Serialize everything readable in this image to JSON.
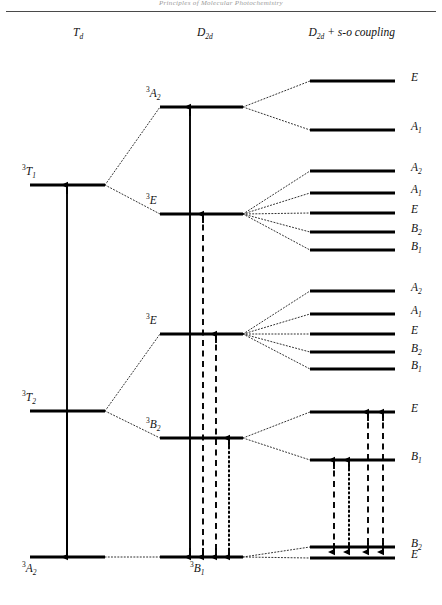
{
  "page": {
    "running_head": "Principles of Molecular Photochemistry",
    "width": 442,
    "height": 605
  },
  "columns": [
    {
      "id": "td",
      "label_html": "T<sub>d</sub>",
      "label": "Td",
      "x": 78
    },
    {
      "id": "d2d",
      "label_html": "D<sub>2d</sub>",
      "label": "D2d",
      "x": 205
    },
    {
      "id": "so",
      "label_html": "D<sub>2d</sub> + s-o coupling",
      "label": "D2d + s-o coupling",
      "x": 352
    }
  ],
  "levels": {
    "td": [
      {
        "name": "3T1",
        "label_sup": "3",
        "label_main": "T",
        "label_sub": "1",
        "y": 185,
        "x1": 30,
        "x2": 105,
        "label_x": 22,
        "label_y": 163
      },
      {
        "name": "3T2",
        "label_sup": "3",
        "label_main": "T",
        "label_sub": "2",
        "y": 411,
        "x1": 30,
        "x2": 105,
        "label_x": 22,
        "label_y": 389
      },
      {
        "name": "3A2",
        "label_sup": "3",
        "label_main": "A",
        "label_sub": "2",
        "y": 557,
        "x1": 30,
        "x2": 105,
        "label_x": 22,
        "label_y": 560
      }
    ],
    "d2d": [
      {
        "name": "3A2",
        "label_sup": "3",
        "label_main": "A",
        "label_sub": "2",
        "y": 107,
        "x1": 160,
        "x2": 243,
        "label_x": 146,
        "label_y": 85
      },
      {
        "name": "3E-upper",
        "label_sup": "3",
        "label_main": "E",
        "label_sub": "",
        "y": 214,
        "x1": 160,
        "x2": 243,
        "label_x": 146,
        "label_y": 192
      },
      {
        "name": "3E-lower",
        "label_sup": "3",
        "label_main": "E",
        "label_sub": "",
        "y": 334,
        "x1": 160,
        "x2": 243,
        "label_x": 146,
        "label_y": 312
      },
      {
        "name": "3B2",
        "label_sup": "3",
        "label_main": "B",
        "label_sub": "2",
        "y": 438,
        "x1": 160,
        "x2": 243,
        "label_x": 146,
        "label_y": 416
      },
      {
        "name": "3B1",
        "label_sup": "3",
        "label_main": "B",
        "label_sub": "1",
        "y": 557,
        "x1": 160,
        "x2": 243,
        "label_x": 190,
        "label_y": 560
      }
    ],
    "so": [
      {
        "name": "E-1",
        "label_main": "E",
        "label_sub": "",
        "y": 81,
        "x1": 310,
        "x2": 395
      },
      {
        "name": "A1-1",
        "label_main": "A",
        "label_sub": "1",
        "y": 130,
        "x1": 310,
        "x2": 395
      },
      {
        "name": "A2-2",
        "label_main": "A",
        "label_sub": "2",
        "y": 171,
        "x1": 310,
        "x2": 395
      },
      {
        "name": "A1-2",
        "label_main": "A",
        "label_sub": "1",
        "y": 193,
        "x1": 310,
        "x2": 395
      },
      {
        "name": "E-2",
        "label_main": "E",
        "label_sub": "",
        "y": 213,
        "x1": 310,
        "x2": 395
      },
      {
        "name": "B2-2",
        "label_main": "B",
        "label_sub": "2",
        "y": 232,
        "x1": 310,
        "x2": 395
      },
      {
        "name": "B1-2",
        "label_main": "B",
        "label_sub": "1",
        "y": 250,
        "x1": 310,
        "x2": 395
      },
      {
        "name": "A2-3",
        "label_main": "A",
        "label_sub": "2",
        "y": 291,
        "x1": 310,
        "x2": 395
      },
      {
        "name": "A1-3",
        "label_main": "A",
        "label_sub": "1",
        "y": 314,
        "x1": 310,
        "x2": 395
      },
      {
        "name": "E-3",
        "label_main": "E",
        "label_sub": "",
        "y": 334,
        "x1": 310,
        "x2": 395
      },
      {
        "name": "B2-3",
        "label_main": "B",
        "label_sub": "2",
        "y": 352,
        "x1": 310,
        "x2": 395
      },
      {
        "name": "B1-3",
        "label_main": "B",
        "label_sub": "1",
        "y": 369,
        "x1": 310,
        "x2": 395
      },
      {
        "name": "E-4",
        "label_main": "E",
        "label_sub": "",
        "y": 412,
        "x1": 310,
        "x2": 395
      },
      {
        "name": "B1-4",
        "label_main": "B",
        "label_sub": "1",
        "y": 460,
        "x1": 310,
        "x2": 395
      },
      {
        "name": "B2-5",
        "label_main": "B",
        "label_sub": "2",
        "y": 547,
        "x1": 310,
        "x2": 395
      },
      {
        "name": "E-5",
        "label_main": "E",
        "label_sub": "",
        "y": 558,
        "x1": 310,
        "x2": 395
      }
    ]
  },
  "correlations": [
    {
      "from_x": 105,
      "from_y": 185,
      "to_x": 160,
      "to_y": 107
    },
    {
      "from_x": 105,
      "from_y": 185,
      "to_x": 160,
      "to_y": 214
    },
    {
      "from_x": 105,
      "from_y": 411,
      "to_x": 160,
      "to_y": 334
    },
    {
      "from_x": 105,
      "from_y": 411,
      "to_x": 160,
      "to_y": 438
    },
    {
      "from_x": 105,
      "from_y": 557,
      "to_x": 160,
      "to_y": 557
    },
    {
      "from_x": 243,
      "from_y": 107,
      "to_x": 310,
      "to_y": 81
    },
    {
      "from_x": 243,
      "from_y": 107,
      "to_x": 310,
      "to_y": 130
    },
    {
      "from_x": 243,
      "from_y": 214,
      "to_x": 310,
      "to_y": 171
    },
    {
      "from_x": 243,
      "from_y": 214,
      "to_x": 310,
      "to_y": 193
    },
    {
      "from_x": 243,
      "from_y": 214,
      "to_x": 310,
      "to_y": 213
    },
    {
      "from_x": 243,
      "from_y": 214,
      "to_x": 310,
      "to_y": 232
    },
    {
      "from_x": 243,
      "from_y": 214,
      "to_x": 310,
      "to_y": 250
    },
    {
      "from_x": 243,
      "from_y": 334,
      "to_x": 310,
      "to_y": 291
    },
    {
      "from_x": 243,
      "from_y": 334,
      "to_x": 310,
      "to_y": 314
    },
    {
      "from_x": 243,
      "from_y": 334,
      "to_x": 310,
      "to_y": 334
    },
    {
      "from_x": 243,
      "from_y": 334,
      "to_x": 310,
      "to_y": 352
    },
    {
      "from_x": 243,
      "from_y": 334,
      "to_x": 310,
      "to_y": 369
    },
    {
      "from_x": 243,
      "from_y": 438,
      "to_x": 310,
      "to_y": 412
    },
    {
      "from_x": 243,
      "from_y": 438,
      "to_x": 310,
      "to_y": 460
    },
    {
      "from_x": 243,
      "from_y": 557,
      "to_x": 310,
      "to_y": 547
    },
    {
      "from_x": 243,
      "from_y": 557,
      "to_x": 310,
      "to_y": 558
    }
  ],
  "transitions": [
    {
      "name": "td-absorption-T1",
      "x": 67,
      "y_top": 185,
      "y_bottom": 557,
      "style": "solid",
      "arrow": "up"
    },
    {
      "name": "td-absorption-T2",
      "x": 67,
      "y_top": 411,
      "y_bottom": 557,
      "style": "solid",
      "arrow": "down"
    },
    {
      "name": "d2d-A2-abs",
      "x": 190,
      "y_top": 107,
      "y_bottom": 557,
      "style": "solid",
      "arrow": "both"
    },
    {
      "name": "d2d-E-upper-abs",
      "x": 203,
      "y_top": 214,
      "y_bottom": 557,
      "style": "dashed",
      "arrow": "both"
    },
    {
      "name": "d2d-E-lower-abs",
      "x": 216,
      "y_top": 334,
      "y_bottom": 557,
      "style": "dashed",
      "arrow": "both"
    },
    {
      "name": "d2d-B2-abs",
      "x": 229,
      "y_top": 438,
      "y_bottom": 557,
      "style": "dotted",
      "arrow": "both"
    },
    {
      "name": "so-B1-to-bottom-a",
      "x": 334,
      "y_top": 460,
      "y_bottom": 552,
      "style": "dashed",
      "arrow": "both"
    },
    {
      "name": "so-B1-to-bottom-b",
      "x": 349,
      "y_top": 460,
      "y_bottom": 552,
      "style": "dotted",
      "arrow": "both"
    },
    {
      "name": "so-E-to-bottom-a",
      "x": 368,
      "y_top": 412,
      "y_bottom": 552,
      "style": "dashed",
      "arrow": "both"
    },
    {
      "name": "so-E-to-bottom-b",
      "x": 383,
      "y_top": 412,
      "y_bottom": 552,
      "style": "dashed",
      "arrow": "both"
    }
  ]
}
